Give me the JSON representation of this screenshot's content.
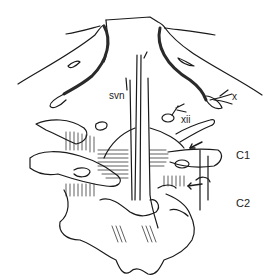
{
  "figure": {
    "labels": {
      "svn": "svn",
      "xii": "xii",
      "x": "x",
      "c1": "C1",
      "c2": "C2"
    },
    "colors": {
      "ink": "#1a1a1a",
      "background": "#ffffff"
    }
  }
}
